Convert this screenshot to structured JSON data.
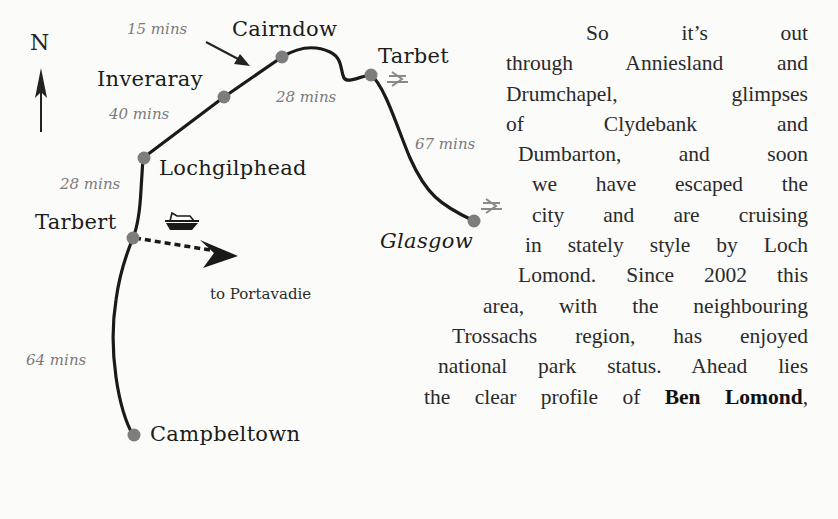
{
  "map": {
    "north_label": "N",
    "places": [
      {
        "name": "Cairndow"
      },
      {
        "name": "Tarbet"
      },
      {
        "name": "Inveraray"
      },
      {
        "name": "Lochgilphead"
      },
      {
        "name": "Tarbert"
      },
      {
        "name": "Glasgow"
      },
      {
        "name": "Campbeltown"
      }
    ],
    "times": [
      {
        "label": "15 mins"
      },
      {
        "label": "40 mins"
      },
      {
        "label": "28 mins"
      },
      {
        "label": "28 mins"
      },
      {
        "label": "67 mins"
      },
      {
        "label": "64 mins"
      }
    ],
    "ferry_note": "to Portavadie",
    "icons": [
      "north-arrow-icon",
      "ferry-icon",
      "rail-icon",
      "rail-icon"
    ],
    "colors": {
      "route_line": "#1a1a1a",
      "stop_dot": "#7d7d7d",
      "time_text": "#7a7a7a",
      "place_text": "#1c1c1c"
    }
  },
  "text": {
    "lines": [
      {
        "content": "So it’s out"
      },
      {
        "content": "through Anniesland and"
      },
      {
        "content": "Drumchapel, glimpses"
      },
      {
        "content": "of Clydebank and"
      },
      {
        "content": "Dumbarton, and soon"
      },
      {
        "content": "we have escaped the"
      },
      {
        "content": "city and are cruising"
      },
      {
        "content": "in stately style by Loch"
      },
      {
        "content": "Lomond. Since 2002 this"
      },
      {
        "content": "area, with the neighbouring"
      },
      {
        "content": "Trossachs region, has enjoyed"
      },
      {
        "content": "national park status. Ahead lies"
      },
      {
        "before": "the clear profile of ",
        "bold": "Ben Lomond",
        "after": ","
      }
    ]
  }
}
